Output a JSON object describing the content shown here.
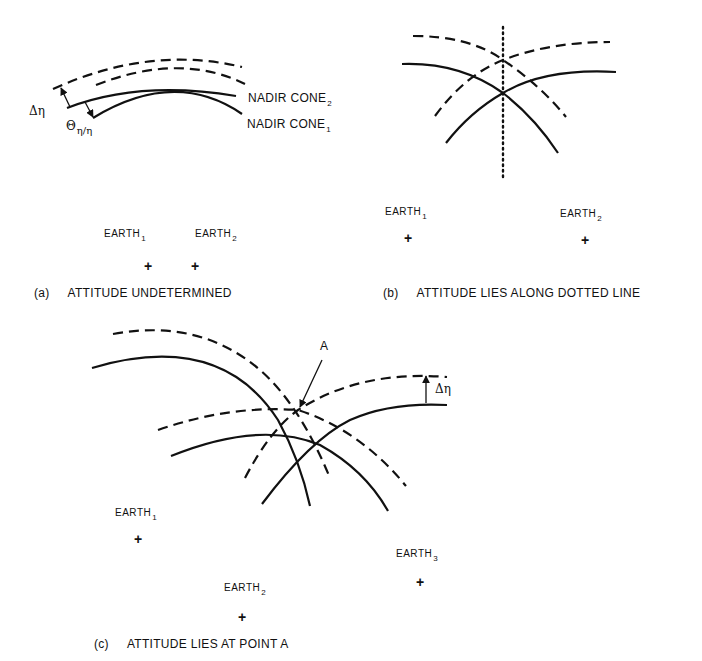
{
  "figure": {
    "panels": [
      {
        "id": "a",
        "caption_letter": "(a)",
        "caption": "ATTITUDE UNDETERMINED",
        "labels": {
          "cone2": "NADIR CONE",
          "cone2_sub": "2",
          "cone1": "NADIR CONE",
          "cone1_sub": "1",
          "delta_eta": "Δη",
          "theta": "Θ",
          "theta_sub": "η/η"
        },
        "earths": [
          {
            "label": "EARTH",
            "sub": "1",
            "marker": "+"
          },
          {
            "label": "EARTH",
            "sub": "2",
            "marker": "+"
          }
        ]
      },
      {
        "id": "b",
        "caption_letter": "(b)",
        "caption": "ATTITUDE LIES ALONG DOTTED LINE",
        "earths": [
          {
            "label": "EARTH",
            "sub": "1",
            "marker": "+"
          },
          {
            "label": "EARTH",
            "sub": "2",
            "marker": "+"
          }
        ]
      },
      {
        "id": "c",
        "caption_letter": "(c)",
        "caption": "ATTITUDE LIES AT POINT A",
        "labels": {
          "point": "A",
          "delta_eta": "Δη"
        },
        "earths": [
          {
            "label": "EARTH",
            "sub": "1",
            "marker": "+"
          },
          {
            "label": "EARTH",
            "sub": "2",
            "marker": "+"
          },
          {
            "label": "EARTH",
            "sub": "3",
            "marker": "+"
          }
        ]
      }
    ],
    "legend": {
      "solid_line": "nadir cone",
      "dashed_line": "nadir cone with uncertainty Δη",
      "dotted_line": "locus of attitude"
    }
  }
}
